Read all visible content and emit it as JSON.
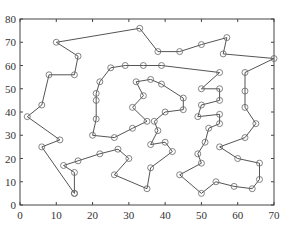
{
  "chart_data": {
    "type": "line",
    "subtype": "tsp-route",
    "title": "",
    "xlabel": "",
    "ylabel": "",
    "xlim": [
      0,
      70
    ],
    "ylim": [
      0,
      80
    ],
    "xticks": [
      0,
      10,
      20,
      30,
      40,
      50,
      60,
      70
    ],
    "yticks": [
      0,
      10,
      20,
      30,
      40,
      50,
      60,
      70,
      80
    ],
    "grid": false,
    "marker": "circle-open",
    "line_color": "#555555",
    "route": [
      [
        15,
        5
      ],
      [
        15,
        14
      ],
      [
        12,
        17
      ],
      [
        16,
        19
      ],
      [
        22,
        22
      ],
      [
        27,
        24
      ],
      [
        30,
        20
      ],
      [
        26,
        13
      ],
      [
        35,
        7
      ],
      [
        36,
        16
      ],
      [
        42,
        23
      ],
      [
        40,
        27
      ],
      [
        36,
        26
      ],
      [
        38,
        32
      ],
      [
        37,
        36
      ],
      [
        40,
        40
      ],
      [
        45,
        41
      ],
      [
        45,
        46
      ],
      [
        39,
        52
      ],
      [
        36,
        54
      ],
      [
        32,
        53
      ],
      [
        34,
        47
      ],
      [
        31,
        42
      ],
      [
        35,
        36
      ],
      [
        31,
        33
      ],
      [
        26,
        29
      ],
      [
        20,
        30
      ],
      [
        21,
        37
      ],
      [
        21,
        45
      ],
      [
        21,
        48
      ],
      [
        22,
        53
      ],
      [
        25,
        59
      ],
      [
        29,
        60
      ],
      [
        34,
        60
      ],
      [
        39,
        60
      ],
      [
        55,
        57
      ],
      [
        50,
        50
      ],
      [
        55,
        50
      ],
      [
        55,
        45
      ],
      [
        50,
        43
      ],
      [
        49,
        38
      ],
      [
        55,
        39
      ],
      [
        55,
        35
      ],
      [
        52,
        33
      ],
      [
        51,
        27
      ],
      [
        49,
        22
      ],
      [
        50,
        18
      ],
      [
        44,
        13
      ],
      [
        50,
        5
      ],
      [
        54,
        10
      ],
      [
        59,
        8
      ],
      [
        64,
        7
      ],
      [
        66,
        11
      ],
      [
        66,
        18
      ],
      [
        60,
        20
      ],
      [
        55,
        25
      ],
      [
        62,
        29
      ],
      [
        65,
        35
      ],
      [
        62,
        42
      ],
      [
        62,
        49
      ],
      [
        62,
        57
      ],
      [
        70,
        63
      ],
      [
        56,
        65
      ],
      [
        57,
        72
      ],
      [
        50,
        69
      ],
      [
        44,
        66
      ],
      [
        38,
        66
      ],
      [
        33,
        76
      ],
      [
        10,
        70
      ],
      [
        16,
        64
      ],
      [
        15,
        56
      ],
      [
        8,
        56
      ],
      [
        6,
        43
      ],
      [
        2,
        38
      ],
      [
        11,
        28
      ],
      [
        6,
        25
      ],
      [
        15,
        5
      ]
    ]
  }
}
